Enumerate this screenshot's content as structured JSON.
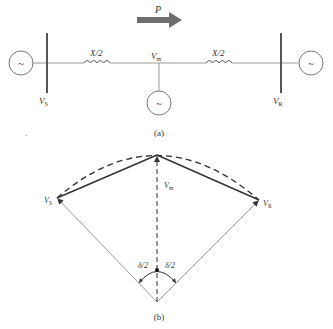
{
  "figure_a": {
    "caption": "(a)",
    "power_flow_label": "P",
    "sending_bus_label": "V",
    "sending_bus_sub": "S",
    "receiving_bus_label": "V",
    "receiving_bus_sub": "R",
    "midpoint_label": "V",
    "midpoint_sub": "m",
    "left_reactance_label": "X/2",
    "right_reactance_label": "X/2",
    "generator_symbol": "~"
  },
  "figure_b": {
    "caption": "(b)",
    "vs_label": "V",
    "vs_sub": "S",
    "vr_label": "V",
    "vr_sub": "R",
    "vm_label": "V",
    "vm_sub": "m",
    "left_angle_label": "δ/2",
    "right_angle_label": "δ/2"
  },
  "colors": {
    "line": "#9a9a9a",
    "dark_line": "#333333",
    "arrow": "#6e6e6e",
    "bus": "#555555"
  },
  "stray_mark": "."
}
